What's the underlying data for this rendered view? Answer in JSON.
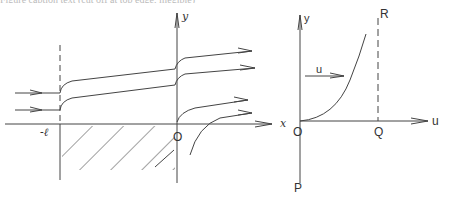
{
  "top_cut_text": "Figure caption text (cut off at top edge, illegible)",
  "left_diagram": {
    "axis_x_label": "x",
    "axis_y_label": "y",
    "origin_label": "O",
    "plate_edge_label": "-ℓ",
    "description": "Streamlines flowing past a semi-infinite hatched region starting at x = -ℓ; flow lines shift upward at x = -ℓ and at O"
  },
  "right_diagram": {
    "axis_y_label": "y",
    "axis_u_label": "u",
    "origin_label": "O",
    "point_q_label": "Q",
    "point_r_label": "R",
    "point_p_label": "P",
    "velocity_label": "u",
    "description": "Velocity profile u(y) rising from O, bounded by dashed line QR"
  },
  "colors": {
    "line": "#444444",
    "background": "#ffffff"
  }
}
